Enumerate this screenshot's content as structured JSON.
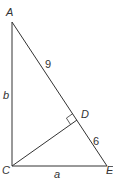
{
  "diagram": {
    "type": "right-triangle-with-altitude",
    "stroke_color": "#333333",
    "vertices": {
      "A": {
        "label": "A",
        "x": 12,
        "y": 22
      },
      "C": {
        "label": "C",
        "x": 12,
        "y": 166
      },
      "E": {
        "label": "E",
        "x": 107,
        "y": 166
      },
      "D": {
        "label": "D",
        "x": 77,
        "y": 120
      }
    },
    "segment_labels": {
      "AD": "9",
      "DE": "6",
      "AC": "b",
      "CE": "a"
    },
    "right_angle_marker_at": "D"
  }
}
